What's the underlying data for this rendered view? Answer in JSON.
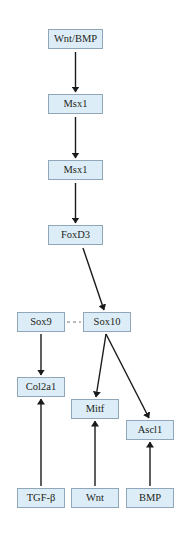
{
  "diagram": {
    "colors": {
      "node_fill": "#ddedf7",
      "node_border": "#8fa7b8",
      "edge": "#1a1a1a",
      "text": "#231f20"
    },
    "nodes": [
      {
        "id": "wnt_bmp",
        "label": "Wnt/BMP",
        "x": 48,
        "y": 29,
        "w": 55,
        "h": 20
      },
      {
        "id": "msx1_a",
        "label": "Msx1",
        "x": 48,
        "y": 94,
        "w": 55,
        "h": 20
      },
      {
        "id": "msx1_b",
        "label": "Msx1",
        "x": 48,
        "y": 160,
        "w": 55,
        "h": 20
      },
      {
        "id": "foxd3",
        "label": "FoxD3",
        "x": 48,
        "y": 225,
        "w": 55,
        "h": 20
      },
      {
        "id": "sox9",
        "label": "Sox9",
        "x": 17,
        "y": 312,
        "w": 48,
        "h": 20
      },
      {
        "id": "sox10",
        "label": "Sox10",
        "x": 83,
        "y": 312,
        "w": 48,
        "h": 20
      },
      {
        "id": "col2a1",
        "label": "Col2a1",
        "x": 17,
        "y": 377,
        "w": 48,
        "h": 20
      },
      {
        "id": "mitf",
        "label": "Mitf",
        "x": 71,
        "y": 399,
        "w": 48,
        "h": 20
      },
      {
        "id": "ascl1",
        "label": "Ascl1",
        "x": 126,
        "y": 420,
        "w": 48,
        "h": 20
      },
      {
        "id": "tgfb",
        "label": "TGF-β",
        "x": 17,
        "y": 488,
        "w": 48,
        "h": 20
      },
      {
        "id": "wnt",
        "label": "Wnt",
        "x": 71,
        "y": 488,
        "w": 48,
        "h": 20
      },
      {
        "id": "bmp",
        "label": "BMP",
        "x": 126,
        "y": 488,
        "w": 48,
        "h": 20
      }
    ],
    "edges": [
      {
        "from": "wnt_bmp",
        "to": "msx1_a",
        "type": "arrow"
      },
      {
        "from": "msx1_a",
        "to": "msx1_b",
        "type": "arrow"
      },
      {
        "from": "msx1_b",
        "to": "foxd3",
        "type": "arrow"
      },
      {
        "from": "foxd3",
        "to": "sox10",
        "type": "arrow"
      },
      {
        "from": "sox9",
        "to": "sox10",
        "type": "dashed"
      },
      {
        "from": "sox9",
        "to": "col2a1",
        "type": "arrow"
      },
      {
        "from": "sox10",
        "to": "mitf",
        "type": "arrow"
      },
      {
        "from": "sox10",
        "to": "ascl1",
        "type": "arrow"
      },
      {
        "from": "tgfb",
        "to": "col2a1",
        "type": "arrow"
      },
      {
        "from": "wnt",
        "to": "mitf",
        "type": "arrow"
      },
      {
        "from": "bmp",
        "to": "ascl1",
        "type": "arrow"
      }
    ]
  }
}
